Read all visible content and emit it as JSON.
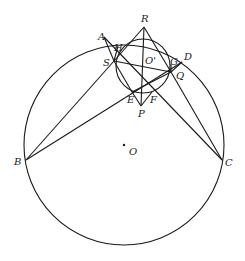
{
  "diagram": {
    "type": "geometry",
    "colors": {
      "stroke": "#1a1a1a",
      "background": "#ffffff",
      "label": "#222222"
    },
    "circles": [
      {
        "name": "O",
        "cx": 124,
        "cy": 145,
        "r": 100
      },
      {
        "name": "O'",
        "cx": 143,
        "cy": 66,
        "r": 27
      }
    ],
    "points": {
      "A": [
        104,
        37
      ],
      "B": [
        26,
        160
      ],
      "C": [
        222,
        160
      ],
      "D": [
        182,
        62
      ],
      "R": [
        144,
        27
      ],
      "P": [
        141,
        106
      ],
      "S": [
        114,
        61
      ],
      "Q": [
        171,
        72
      ],
      "H": [
        118,
        46
      ],
      "G": [
        171,
        64
      ],
      "E": [
        132,
        92
      ],
      "F": [
        152,
        92
      ],
      "O": [
        124,
        145
      ],
      "O'": [
        143,
        66
      ]
    },
    "labels": [
      {
        "text": "R",
        "x": 142,
        "y": 22
      },
      {
        "text": "A",
        "x": 98,
        "y": 40
      },
      {
        "text": "H",
        "x": 114,
        "y": 51
      },
      {
        "text": "D",
        "x": 184,
        "y": 60
      },
      {
        "text": "S",
        "x": 103,
        "y": 66
      },
      {
        "text": "O'",
        "x": 145,
        "y": 64
      },
      {
        "text": "G",
        "x": 170,
        "y": 65
      },
      {
        "text": "Q",
        "x": 176,
        "y": 79
      },
      {
        "text": "E",
        "x": 127,
        "y": 103
      },
      {
        "text": "F",
        "x": 150,
        "y": 103
      },
      {
        "text": "P",
        "x": 138,
        "y": 117
      },
      {
        "text": "O",
        "x": 129,
        "y": 155
      },
      {
        "text": "B",
        "x": 14,
        "y": 165
      },
      {
        "text": "C",
        "x": 225,
        "y": 166
      }
    ]
  }
}
